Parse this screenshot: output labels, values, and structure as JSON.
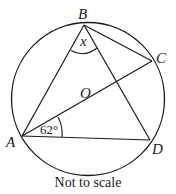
{
  "diagram": {
    "points": {
      "A": {
        "label": "A"
      },
      "B": {
        "label": "B"
      },
      "C": {
        "label": "C"
      },
      "D": {
        "label": "D"
      },
      "O": {
        "label": "O"
      }
    },
    "angles": {
      "at_B": {
        "label": "x"
      },
      "at_A": {
        "label": "62°"
      }
    },
    "caption": "Not to scale",
    "stroke_color": "#1a1a1a"
  }
}
